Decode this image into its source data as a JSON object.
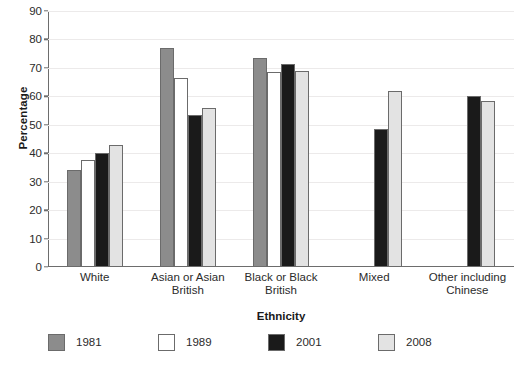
{
  "chart_data": {
    "type": "bar",
    "title": "",
    "xlabel": "Ethnicity",
    "ylabel": "Percentage",
    "ylim": [
      0,
      90
    ],
    "yticks": [
      0,
      10,
      20,
      30,
      40,
      50,
      60,
      70,
      80,
      90
    ],
    "grid": true,
    "legend_position": "bottom",
    "categories": [
      "White",
      "Asian or Asian British",
      "Black or Black British",
      "Mixed",
      "Other including Chinese"
    ],
    "category_lines": [
      [
        "White"
      ],
      [
        "Asian or Asian",
        "British"
      ],
      [
        "Black or Black",
        "British"
      ],
      [
        "Mixed"
      ],
      [
        "Other including",
        "Chinese"
      ]
    ],
    "series": [
      {
        "name": "1981",
        "color": "#8c8c8c",
        "values": [
          34,
          77,
          73.5,
          null,
          null
        ]
      },
      {
        "name": "1989",
        "color": "#ffffff",
        "values": [
          37.5,
          66.5,
          68.5,
          null,
          null
        ]
      },
      {
        "name": "2001",
        "color": "#1a1a1a",
        "values": [
          40,
          53.5,
          71.5,
          48.5,
          60
        ]
      },
      {
        "name": "2008",
        "color": "#e3e3e3",
        "values": [
          43,
          56,
          69,
          62,
          58.5
        ]
      }
    ]
  },
  "axis": {
    "grid_color": "#eceaea",
    "axis_color": "#6d6d6d",
    "bar_outline_color": "#6b6b6b"
  }
}
